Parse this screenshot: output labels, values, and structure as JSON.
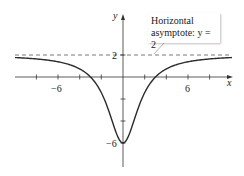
{
  "chart_data": {
    "type": "line",
    "title": "",
    "xlabel": "x",
    "ylabel": "y",
    "function": "y = 2 - 24/(x^2 + 3)",
    "xlim": [
      -10,
      10
    ],
    "ylim": [
      -8,
      6
    ],
    "x_ticks": [
      -10,
      -8,
      -6,
      -4,
      -2,
      2,
      4,
      6,
      8
    ],
    "x_tick_labels": {
      "-6": "-6",
      "6": "6"
    },
    "y_ticks": [
      -6,
      -4,
      -2,
      2
    ],
    "y_tick_labels": {
      "2": "2",
      "-6": "-6"
    },
    "asymptote": {
      "type": "horizontal",
      "y": 2,
      "style": "dashed"
    },
    "annotation": {
      "line1": "Horizontal",
      "line2": "asymptote: y = 2"
    },
    "key_points": [
      {
        "x": 0,
        "y": -6
      },
      {
        "x": -3,
        "y": 0
      },
      {
        "x": 3,
        "y": 0
      }
    ],
    "grid": false,
    "legend": null
  },
  "labels": {
    "x_axis": "x",
    "y_axis": "y",
    "tick_neg6_x": "−6",
    "tick_6_x": "6",
    "tick_2_y": "2",
    "tick_neg6_y": "−6",
    "note_line1": "Horizontal",
    "note_line2": "asymptote: y = 2"
  },
  "colors": {
    "curve": "#2b2b2b",
    "axis": "#333333",
    "dash": "#555555"
  }
}
